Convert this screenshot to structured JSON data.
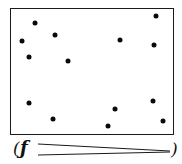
{
  "figure": {
    "type": "dot-scatter-diagram",
    "frame": {
      "left": 10,
      "top": 8,
      "width": 164,
      "height": 127,
      "stroke": "#1a1a1a"
    },
    "dot_color": "#0a0a0a",
    "dots": [
      {
        "x": 35,
        "y": 23
      },
      {
        "x": 22,
        "y": 41
      },
      {
        "x": 55,
        "y": 35
      },
      {
        "x": 29,
        "y": 57
      },
      {
        "x": 68,
        "y": 61
      },
      {
        "x": 156,
        "y": 16
      },
      {
        "x": 120,
        "y": 40
      },
      {
        "x": 154,
        "y": 45
      },
      {
        "x": 29,
        "y": 103
      },
      {
        "x": 53,
        "y": 119
      },
      {
        "x": 115,
        "y": 109
      },
      {
        "x": 108,
        "y": 126
      },
      {
        "x": 153,
        "y": 101
      },
      {
        "x": 163,
        "y": 121
      }
    ],
    "caption": {
      "open_paren": "(",
      "symbol": "ƒ",
      "close_paren": ")"
    }
  }
}
